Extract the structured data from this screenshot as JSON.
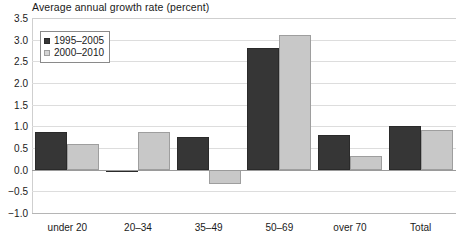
{
  "chart_data": {
    "type": "bar",
    "title": "Average annual growth rate (percent)",
    "xlabel": "",
    "ylabel": "",
    "categories": [
      "under 20",
      "20–34",
      "35–49",
      "50–69",
      "over 70",
      "Total"
    ],
    "series": [
      {
        "name": "1995–2005",
        "color": "#363636",
        "values": [
          0.87,
          -0.05,
          0.75,
          2.8,
          0.8,
          1.0
        ]
      },
      {
        "name": "2000–2010",
        "color": "#c8c8c8",
        "values": [
          0.6,
          0.88,
          -0.32,
          3.1,
          0.31,
          0.92
        ]
      }
    ],
    "ylim": [
      -1.0,
      3.5
    ],
    "ytick_labels": [
      "3.5",
      "3.0",
      "2.5",
      "2.0",
      "1.5",
      "1.0",
      "0.5",
      "0.0",
      "−0.5",
      "−1.0"
    ],
    "ytick_values": [
      3.5,
      3.0,
      2.5,
      2.0,
      1.5,
      1.0,
      0.5,
      0.0,
      -0.5,
      -1.0
    ],
    "grid": true,
    "legend_position": "top-left"
  }
}
